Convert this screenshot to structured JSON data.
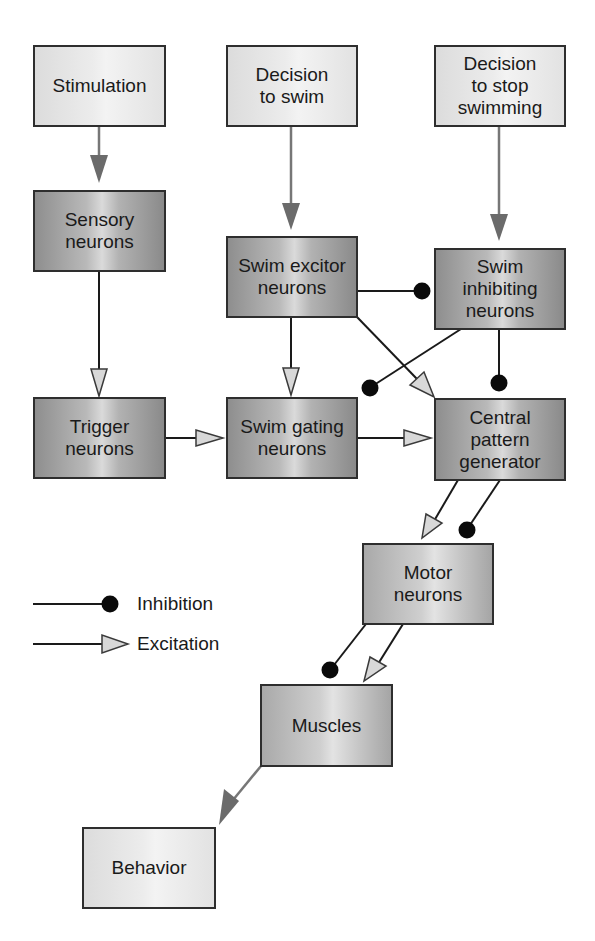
{
  "diagram": {
    "nodes": {
      "stimulation": {
        "label": "Stimulation",
        "shade": "light"
      },
      "decision_swim": {
        "label": "Decision\nto swim",
        "shade": "light"
      },
      "decision_stop": {
        "label": "Decision\nto stop\nswimming",
        "shade": "light"
      },
      "sensory": {
        "label": "Sensory\nneurons",
        "shade": "dark"
      },
      "swim_excitor": {
        "label": "Swim excitor\nneurons",
        "shade": "dark"
      },
      "swim_inhibiting": {
        "label": "Swim\ninhibiting\nneurons",
        "shade": "dark"
      },
      "trigger": {
        "label": "Trigger\nneurons",
        "shade": "dark"
      },
      "swim_gating": {
        "label": "Swim gating\nneurons",
        "shade": "dark"
      },
      "cpg": {
        "label": "Central\npattern\ngenerator",
        "shade": "dark"
      },
      "motor": {
        "label": "Motor\nneurons",
        "shade": "mid"
      },
      "muscles": {
        "label": "Muscles",
        "shade": "mid"
      },
      "behavior": {
        "label": "Behavior",
        "shade": "light"
      }
    },
    "edges": [
      {
        "from": "Stimulation",
        "to": "Sensory neurons",
        "type": "input"
      },
      {
        "from": "Decision to swim",
        "to": "Swim excitor neurons",
        "type": "input"
      },
      {
        "from": "Decision to stop swimming",
        "to": "Swim inhibiting neurons",
        "type": "input"
      },
      {
        "from": "Sensory neurons",
        "to": "Trigger neurons",
        "type": "excitation"
      },
      {
        "from": "Trigger neurons",
        "to": "Swim gating neurons",
        "type": "excitation"
      },
      {
        "from": "Swim excitor neurons",
        "to": "Swim gating neurons",
        "type": "excitation"
      },
      {
        "from": "Swim excitor neurons",
        "to": "Swim inhibiting neurons",
        "type": "inhibition"
      },
      {
        "from": "Swim excitor neurons",
        "to": "Central pattern generator",
        "type": "excitation"
      },
      {
        "from": "Swim inhibiting neurons",
        "to": "Swim gating neurons",
        "type": "inhibition"
      },
      {
        "from": "Swim inhibiting neurons",
        "to": "Central pattern generator",
        "type": "inhibition"
      },
      {
        "from": "Swim gating neurons",
        "to": "Central pattern generator",
        "type": "excitation"
      },
      {
        "from": "Central pattern generator",
        "to": "Motor neurons",
        "type": "excitation"
      },
      {
        "from": "Central pattern generator",
        "to": "Motor neurons",
        "type": "inhibition"
      },
      {
        "from": "Motor neurons",
        "to": "Muscles",
        "type": "inhibition"
      },
      {
        "from": "Motor neurons",
        "to": "Muscles",
        "type": "excitation"
      },
      {
        "from": "Muscles",
        "to": "Behavior",
        "type": "input"
      }
    ],
    "legend": {
      "inhibition": "Inhibition",
      "excitation": "Excitation"
    },
    "colors": {
      "input_arrow": "#6e6e6e",
      "connector_line": "#1a1a1a",
      "excitation_head_fill": "#d8d8d8",
      "inhibition_dot": "#0a0a0a",
      "box_border": "#2e2e2e"
    }
  }
}
